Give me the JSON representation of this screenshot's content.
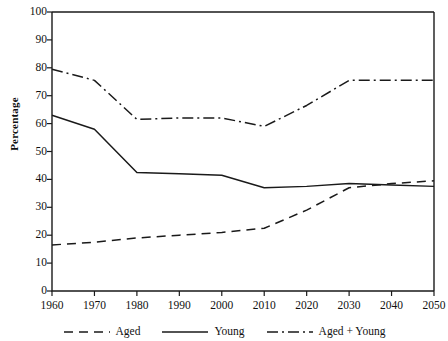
{
  "chart_data": {
    "type": "line",
    "title": "",
    "xlabel": "",
    "ylabel": "Percentage",
    "xlim": [
      1960,
      2050
    ],
    "ylim": [
      0,
      100
    ],
    "grid": false,
    "legend_position": "bottom",
    "x": [
      1960,
      1970,
      1980,
      1990,
      2000,
      2010,
      2020,
      2030,
      2040,
      2050
    ],
    "xticklabels": [
      "1960",
      "1970",
      "1980",
      "1990",
      "2000",
      "2010",
      "2020",
      "2030",
      "2040",
      "2050"
    ],
    "yticks": [
      0,
      10,
      20,
      30,
      40,
      50,
      60,
      70,
      80,
      90,
      100
    ],
    "yticklabels": [
      "0",
      "10",
      "20",
      "30",
      "40",
      "50",
      "60",
      "70",
      "80",
      "90",
      "100"
    ],
    "series": [
      {
        "name": "Aged",
        "style": "dashed",
        "color": "#1a1a1a",
        "values": [
          16.5,
          17.5,
          19.0,
          20.0,
          21.0,
          22.5,
          29.0,
          37.0,
          38.5,
          39.5
        ]
      },
      {
        "name": "Young",
        "style": "solid",
        "color": "#1a1a1a",
        "values": [
          63.0,
          58.0,
          42.5,
          42.0,
          41.5,
          37.0,
          37.5,
          38.5,
          38.0,
          37.5
        ]
      },
      {
        "name": "Aged + Young",
        "style": "dash-dot",
        "color": "#1a1a1a",
        "values": [
          79.5,
          75.5,
          61.5,
          62.0,
          62.0,
          59.0,
          66.5,
          75.5,
          75.5,
          75.5
        ]
      }
    ]
  },
  "legend": {
    "items": [
      {
        "label": "Aged",
        "style": "dashed"
      },
      {
        "label": "Young",
        "style": "solid"
      },
      {
        "label": "Aged + Young",
        "style": "dash-dot"
      }
    ]
  }
}
